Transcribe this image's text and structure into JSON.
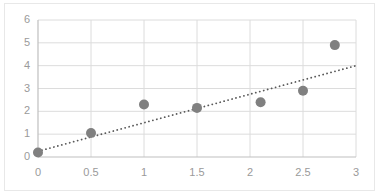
{
  "chart_data": {
    "type": "scatter",
    "title": "",
    "subtitle": "",
    "xlabel": "",
    "ylabel": "",
    "xlim": [
      0,
      3
    ],
    "ylim": [
      0,
      6
    ],
    "xticks": [
      "0",
      "0.5",
      "1",
      "1.5",
      "2",
      "2.5",
      "3"
    ],
    "xtick_values": [
      0,
      0.5,
      1,
      1.5,
      2,
      2.5,
      3
    ],
    "yticks": [
      "0",
      "1",
      "2",
      "3",
      "4",
      "5",
      "6"
    ],
    "ytick_values": [
      0,
      1,
      2,
      3,
      4,
      5,
      6
    ],
    "grid": true,
    "grid_axis": "both",
    "legend": false,
    "legend_position": "none",
    "series": [
      {
        "name": "data-points",
        "marker": "circle",
        "color": "#808080",
        "points": [
          {
            "x": 0,
            "y": 0.2
          },
          {
            "x": 0.5,
            "y": 1.05
          },
          {
            "x": 1,
            "y": 2.3
          },
          {
            "x": 1.5,
            "y": 2.15
          },
          {
            "x": 2.1,
            "y": 2.4
          },
          {
            "x": 2.5,
            "y": 2.9
          },
          {
            "x": 2.8,
            "y": 4.9
          }
        ]
      }
    ],
    "trendline": {
      "name": "linear-trendline",
      "style": "dotted",
      "color": "#595959",
      "x_start": 0,
      "y_start": 0.25,
      "x_end": 3,
      "y_end": 4.0
    },
    "colors": {
      "marker": "#808080",
      "trendline": "#595959",
      "gridline": "#dcdcdc",
      "axis": "#bfbfbf",
      "tick_text": "#9a9a9a",
      "frame": "#e8e8e8",
      "background": "#ffffff"
    }
  }
}
